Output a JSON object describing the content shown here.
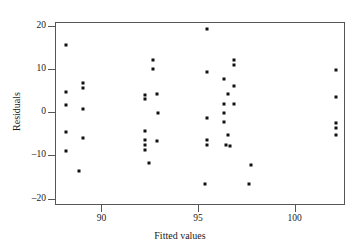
{
  "chart_data": {
    "type": "scatter",
    "title": "",
    "xlabel": "Fitted values",
    "ylabel": "Residuals",
    "xlim": [
      87.6,
      102.6
    ],
    "ylim": [
      -21.5,
      21.0
    ],
    "grid": false,
    "legend": null,
    "xticks": [
      90,
      95,
      100
    ],
    "yticks": [
      20,
      10,
      0,
      -10,
      -20
    ],
    "xtick_labels": [
      "90",
      "95",
      "100"
    ],
    "ytick_labels": [
      "20",
      "10",
      "0",
      "-10",
      "-20"
    ],
    "marker": "square",
    "marker_color": "#111111",
    "points": [
      {
        "x": 88.1,
        "y": 16.0
      },
      {
        "x": 88.1,
        "y": 5.0
      },
      {
        "x": 88.1,
        "y": 2.0
      },
      {
        "x": 88.1,
        "y": -4.4
      },
      {
        "x": 88.1,
        "y": -8.7
      },
      {
        "x": 89.0,
        "y": 7.0
      },
      {
        "x": 89.0,
        "y": 6.0
      },
      {
        "x": 89.0,
        "y": 1.0
      },
      {
        "x": 89.0,
        "y": -5.6
      },
      {
        "x": 88.8,
        "y": -13.3
      },
      {
        "x": 92.6,
        "y": 12.3
      },
      {
        "x": 92.6,
        "y": 10.4
      },
      {
        "x": 92.2,
        "y": 4.2
      },
      {
        "x": 92.2,
        "y": 3.3
      },
      {
        "x": 92.8,
        "y": 4.6
      },
      {
        "x": 92.9,
        "y": 0.0
      },
      {
        "x": 92.2,
        "y": -4.1
      },
      {
        "x": 92.2,
        "y": -6.1
      },
      {
        "x": 92.8,
        "y": -6.3
      },
      {
        "x": 92.2,
        "y": -7.3
      },
      {
        "x": 92.2,
        "y": -8.6
      },
      {
        "x": 92.4,
        "y": -11.6
      },
      {
        "x": 95.4,
        "y": 19.5
      },
      {
        "x": 95.4,
        "y": 9.6
      },
      {
        "x": 95.4,
        "y": -1.0
      },
      {
        "x": 95.4,
        "y": -6.2
      },
      {
        "x": 95.4,
        "y": -7.4
      },
      {
        "x": 95.3,
        "y": -16.4
      },
      {
        "x": 96.8,
        "y": 12.4
      },
      {
        "x": 96.8,
        "y": 11.3
      },
      {
        "x": 96.3,
        "y": 8.0
      },
      {
        "x": 96.8,
        "y": 6.4
      },
      {
        "x": 96.5,
        "y": 4.5
      },
      {
        "x": 96.3,
        "y": 2.3
      },
      {
        "x": 96.8,
        "y": 2.2
      },
      {
        "x": 96.3,
        "y": 0.0
      },
      {
        "x": 96.3,
        "y": -1.9
      },
      {
        "x": 96.5,
        "y": -5.0
      },
      {
        "x": 96.4,
        "y": -7.4
      },
      {
        "x": 96.6,
        "y": -7.6
      },
      {
        "x": 97.7,
        "y": -12.0
      },
      {
        "x": 97.6,
        "y": -16.5
      },
      {
        "x": 102.1,
        "y": 10.0
      },
      {
        "x": 102.1,
        "y": 3.7
      },
      {
        "x": 102.1,
        "y": -2.3
      },
      {
        "x": 102.1,
        "y": -3.3
      },
      {
        "x": 102.1,
        "y": -5.0
      }
    ]
  }
}
